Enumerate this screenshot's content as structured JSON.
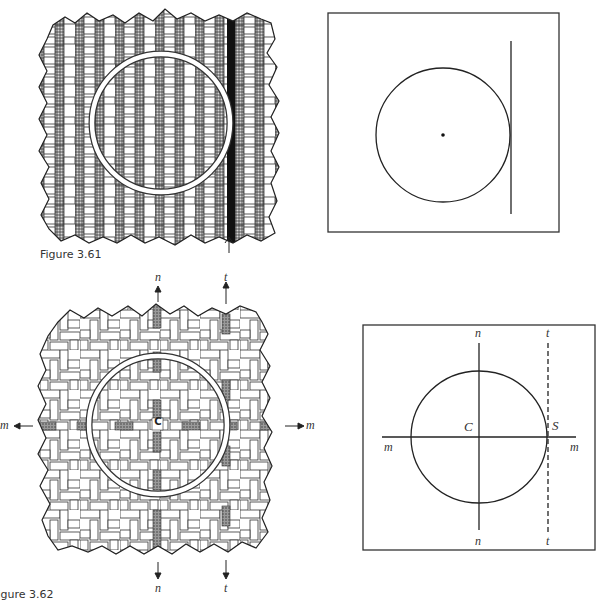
{
  "figures": [
    {
      "id": "fig-3-61",
      "caption": "Figure 3.61",
      "weave_panel": {
        "description": "basket-weave pattern with shaded vertical strands, white ring overlay, one black highlighted strand marked by arrow",
        "arrow": "up-arrow"
      },
      "diagram_panel": {
        "description": "circle with center dot tangent to vertical line inside square frame"
      }
    },
    {
      "id": "fig-3-62",
      "caption": "Figure 3.62",
      "weave_panel": {
        "description": "herringbone/twill weave pattern with shaded axis strands, white ring overlay, center marked C",
        "center_label": "C",
        "labels": {
          "top_n": "n",
          "top_t": "t",
          "left_m": "m",
          "right_m": "m",
          "bottom_n": "n",
          "bottom_t": "t"
        }
      },
      "diagram_panel": {
        "description": "circle with perpendicular axes n and m through center C, dashed tangent line t at point S",
        "labels": {
          "top_n": "n",
          "top_t": "t",
          "left_m": "m",
          "right_m": "m",
          "bottom_n": "n",
          "bottom_t": "t",
          "center": "C",
          "tangent_point": "S"
        }
      }
    }
  ]
}
